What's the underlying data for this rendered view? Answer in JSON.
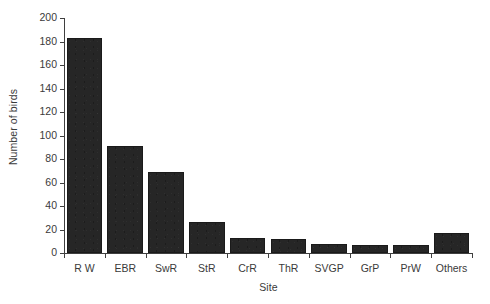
{
  "chart_data": {
    "type": "bar",
    "title": "",
    "xlabel": "Site",
    "ylabel": "Number of birds",
    "categories": [
      "R W",
      "EBR",
      "SwR",
      "StR",
      "CrR",
      "ThR",
      "SVGP",
      "GrP",
      "PrW",
      "Others"
    ],
    "values": [
      183,
      91,
      69,
      26,
      13,
      12,
      8,
      7,
      7,
      17
    ],
    "ylim": [
      0,
      200
    ],
    "ytick_labels": [
      "0",
      "20",
      "40",
      "60",
      "80",
      "100",
      "120",
      "140",
      "160",
      "180",
      "200"
    ],
    "ytick_values": [
      0,
      20,
      40,
      60,
      80,
      100,
      120,
      140,
      160,
      180,
      200
    ],
    "grid": false,
    "legend": null,
    "bar_color": "#262626",
    "axis_color": "#3f3f3f",
    "text_color": "#3a3a3a",
    "background": "#ffffff"
  }
}
